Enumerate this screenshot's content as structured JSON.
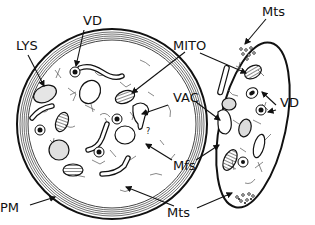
{
  "diagram": {
    "type": "cell-schematic",
    "cells": [
      {
        "id": "round-cell",
        "shape": "circle"
      },
      {
        "id": "elongated-cell",
        "shape": "ellipse"
      }
    ],
    "labels": {
      "lys": "LYS",
      "vd_left": "VD",
      "mito": "MITO",
      "vac": "VAC",
      "mfs": "Mfs",
      "pm": "PM",
      "mts_bottom": "Mts",
      "mts_top": "Mts",
      "vd_right": "VD"
    }
  },
  "colors": {
    "ink": "#111111",
    "granule_fill": "#d9d9d9",
    "background": "#ffffff"
  }
}
